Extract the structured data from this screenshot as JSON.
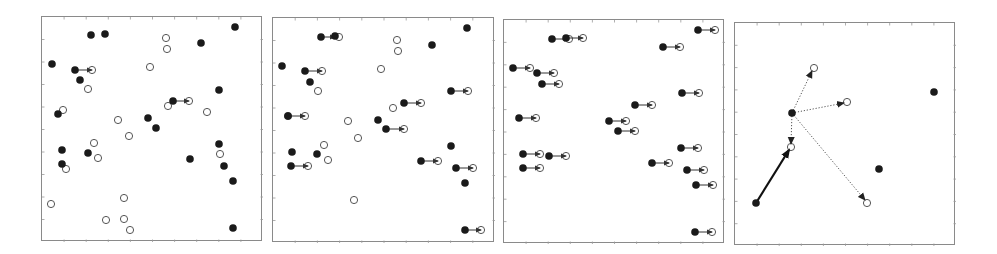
{
  "figure": {
    "colors": {
      "filled": "#1a1a1a",
      "open_stroke": "#555555",
      "frame": "#8a8a8a",
      "arrow": "#333333"
    },
    "panels": [
      {
        "id": "panel-1",
        "frame": {
          "x": 41,
          "y": 16,
          "w": 221,
          "h": 225
        },
        "filled": [
          [
            234,
            26
          ],
          [
            90,
            34
          ],
          [
            104,
            33
          ],
          [
            200,
            42
          ],
          [
            51,
            63
          ],
          [
            74,
            69
          ],
          [
            79,
            79
          ],
          [
            218,
            89
          ],
          [
            172,
            100
          ],
          [
            57,
            113
          ],
          [
            147,
            117
          ],
          [
            155,
            127
          ],
          [
            218,
            143
          ],
          [
            61,
            149
          ],
          [
            87,
            152
          ],
          [
            189,
            158
          ],
          [
            61,
            163
          ],
          [
            223,
            165
          ],
          [
            232,
            180
          ],
          [
            232,
            227
          ]
        ],
        "open": [
          [
            165,
            37
          ],
          [
            166,
            48
          ],
          [
            149,
            66
          ],
          [
            91,
            69
          ],
          [
            87,
            88
          ],
          [
            188,
            100
          ],
          [
            62,
            109
          ],
          [
            167,
            105
          ],
          [
            206,
            111
          ],
          [
            117,
            119
          ],
          [
            128,
            135
          ],
          [
            93,
            142
          ],
          [
            97,
            157
          ],
          [
            219,
            153
          ],
          [
            65,
            168
          ],
          [
            50,
            203
          ],
          [
            123,
            197
          ],
          [
            105,
            219
          ],
          [
            123,
            218
          ],
          [
            129,
            229
          ]
        ],
        "arrows": [
          {
            "from": [
              74,
              69
            ],
            "to": [
              91,
              69
            ],
            "style": "solid-thin"
          },
          {
            "from": [
              172,
              100
            ],
            "to": [
              188,
              100
            ],
            "style": "solid-thin"
          }
        ]
      },
      {
        "id": "panel-2",
        "frame": {
          "x": 272,
          "y": 17,
          "w": 222,
          "h": 225
        },
        "filled": [
          [
            466,
            27
          ],
          [
            320,
            36
          ],
          [
            334,
            35
          ],
          [
            431,
            44
          ],
          [
            281,
            65
          ],
          [
            304,
            70
          ],
          [
            309,
            81
          ],
          [
            450,
            90
          ],
          [
            403,
            102
          ],
          [
            287,
            115
          ],
          [
            377,
            119
          ],
          [
            385,
            128
          ],
          [
            450,
            145
          ],
          [
            291,
            151
          ],
          [
            316,
            153
          ],
          [
            420,
            160
          ],
          [
            290,
            165
          ],
          [
            455,
            167
          ],
          [
            464,
            182
          ],
          [
            464,
            229
          ]
        ],
        "open": [
          [
            396,
            39
          ],
          [
            397,
            50
          ],
          [
            380,
            68
          ],
          [
            321,
            70
          ],
          [
            317,
            90
          ],
          [
            420,
            102
          ],
          [
            392,
            107
          ],
          [
            287,
            115
          ],
          [
            347,
            120
          ],
          [
            357,
            137
          ],
          [
            323,
            144
          ],
          [
            327,
            159
          ],
          [
            353,
            199
          ],
          [
            338,
            36
          ],
          [
            467,
            90
          ],
          [
            403,
            128
          ],
          [
            437,
            160
          ],
          [
            307,
            165
          ],
          [
            472,
            167
          ],
          [
            480,
            229
          ],
          [
            304,
            115
          ]
        ],
        "arrows": [
          {
            "from": [
              320,
              36
            ],
            "to": [
              334,
              36
            ],
            "style": "solid-thin"
          },
          {
            "from": [
              304,
              70
            ],
            "to": [
              321,
              70
            ],
            "style": "solid-thin"
          },
          {
            "from": [
              450,
              90
            ],
            "to": [
              467,
              90
            ],
            "style": "solid-thin"
          },
          {
            "from": [
              403,
              102
            ],
            "to": [
              420,
              102
            ],
            "style": "solid-thin"
          },
          {
            "from": [
              287,
              115
            ],
            "to": [
              304,
              115
            ],
            "style": "solid-thin"
          },
          {
            "from": [
              385,
              128
            ],
            "to": [
              403,
              128
            ],
            "style": "solid-thin"
          },
          {
            "from": [
              420,
              160
            ],
            "to": [
              437,
              160
            ],
            "style": "solid-thin"
          },
          {
            "from": [
              290,
              165
            ],
            "to": [
              307,
              165
            ],
            "style": "solid-thin"
          },
          {
            "from": [
              455,
              167
            ],
            "to": [
              472,
              167
            ],
            "style": "solid-thin"
          },
          {
            "from": [
              464,
              229
            ],
            "to": [
              480,
              229
            ],
            "style": "solid-thin"
          }
        ]
      },
      {
        "id": "panel-3",
        "frame": {
          "x": 503,
          "y": 19,
          "w": 221,
          "h": 224
        },
        "filled": [
          [
            697,
            29
          ],
          [
            551,
            38
          ],
          [
            565,
            37
          ],
          [
            662,
            46
          ],
          [
            512,
            67
          ],
          [
            536,
            72
          ],
          [
            541,
            83
          ],
          [
            681,
            92
          ],
          [
            634,
            104
          ],
          [
            518,
            117
          ],
          [
            608,
            120
          ],
          [
            617,
            130
          ],
          [
            680,
            147
          ],
          [
            522,
            153
          ],
          [
            548,
            155
          ],
          [
            651,
            162
          ],
          [
            522,
            167
          ],
          [
            686,
            169
          ],
          [
            695,
            184
          ],
          [
            694,
            231
          ]
        ],
        "open": [
          [
            714,
            29
          ],
          [
            568,
            38
          ],
          [
            582,
            37
          ],
          [
            679,
            46
          ],
          [
            529,
            67
          ],
          [
            553,
            72
          ],
          [
            558,
            83
          ],
          [
            698,
            92
          ],
          [
            651,
            104
          ],
          [
            535,
            117
          ],
          [
            625,
            120
          ],
          [
            634,
            130
          ],
          [
            697,
            147
          ],
          [
            539,
            153
          ],
          [
            565,
            155
          ],
          [
            668,
            162
          ],
          [
            539,
            167
          ],
          [
            703,
            169
          ],
          [
            712,
            184
          ],
          [
            711,
            231
          ]
        ],
        "arrows": [
          {
            "from": [
              697,
              29
            ],
            "to": [
              714,
              29
            ],
            "style": "solid-thin"
          },
          {
            "from": [
              551,
              38
            ],
            "to": [
              568,
              38
            ],
            "style": "solid-thin"
          },
          {
            "from": [
              565,
              37
            ],
            "to": [
              582,
              37
            ],
            "style": "solid-thin"
          },
          {
            "from": [
              662,
              46
            ],
            "to": [
              679,
              46
            ],
            "style": "solid-thin"
          },
          {
            "from": [
              512,
              67
            ],
            "to": [
              529,
              67
            ],
            "style": "solid-thin"
          },
          {
            "from": [
              536,
              72
            ],
            "to": [
              553,
              72
            ],
            "style": "solid-thin"
          },
          {
            "from": [
              541,
              83
            ],
            "to": [
              558,
              83
            ],
            "style": "solid-thin"
          },
          {
            "from": [
              681,
              92
            ],
            "to": [
              698,
              92
            ],
            "style": "solid-thin"
          },
          {
            "from": [
              634,
              104
            ],
            "to": [
              651,
              104
            ],
            "style": "solid-thin"
          },
          {
            "from": [
              518,
              117
            ],
            "to": [
              535,
              117
            ],
            "style": "solid-thin"
          },
          {
            "from": [
              608,
              120
            ],
            "to": [
              625,
              120
            ],
            "style": "solid-thin"
          },
          {
            "from": [
              617,
              130
            ],
            "to": [
              634,
              130
            ],
            "style": "solid-thin"
          },
          {
            "from": [
              680,
              147
            ],
            "to": [
              697,
              147
            ],
            "style": "solid-thin"
          },
          {
            "from": [
              522,
              153
            ],
            "to": [
              539,
              153
            ],
            "style": "solid-thin"
          },
          {
            "from": [
              548,
              155
            ],
            "to": [
              565,
              155
            ],
            "style": "solid-thin"
          },
          {
            "from": [
              651,
              162
            ],
            "to": [
              668,
              162
            ],
            "style": "solid-thin"
          },
          {
            "from": [
              522,
              167
            ],
            "to": [
              539,
              167
            ],
            "style": "solid-thin"
          },
          {
            "from": [
              686,
              169
            ],
            "to": [
              703,
              169
            ],
            "style": "solid-thin"
          },
          {
            "from": [
              695,
              184
            ],
            "to": [
              712,
              184
            ],
            "style": "solid-thin"
          },
          {
            "from": [
              694,
              231
            ],
            "to": [
              711,
              231
            ],
            "style": "solid-thin"
          }
        ]
      },
      {
        "id": "panel-4",
        "frame": {
          "x": 734,
          "y": 22,
          "w": 221,
          "h": 223
        },
        "filled": [
          [
            755,
            202
          ],
          [
            791,
            112
          ],
          [
            933,
            91
          ],
          [
            878,
            168
          ]
        ],
        "open": [
          [
            813,
            67
          ],
          [
            846,
            101
          ],
          [
            790,
            146
          ],
          [
            866,
            202
          ]
        ],
        "arrows": [
          {
            "from": [
              755,
              202
            ],
            "to": [
              788,
              149
            ],
            "style": "solid-thick"
          },
          {
            "from": [
              791,
              112
            ],
            "to": [
              811,
              70
            ],
            "style": "dotted"
          },
          {
            "from": [
              791,
              112
            ],
            "to": [
              843,
              102
            ],
            "style": "dotted"
          },
          {
            "from": [
              791,
              112
            ],
            "to": [
              790,
              143
            ],
            "style": "dotted"
          },
          {
            "from": [
              791,
              112
            ],
            "to": [
              864,
              199
            ],
            "style": "dotted"
          }
        ]
      }
    ]
  }
}
